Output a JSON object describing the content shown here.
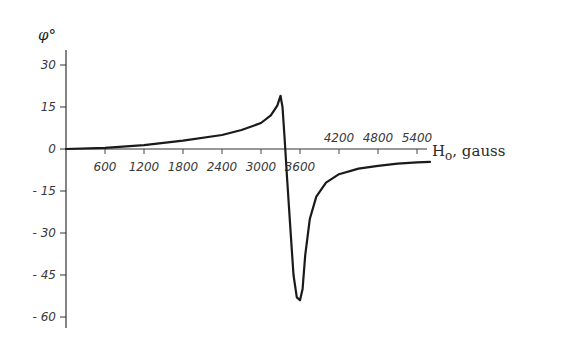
{
  "chart_data": {
    "type": "line",
    "title": "",
    "xlabel": "H",
    "xlabel_subscript": "o",
    "xlabel_unit": ", gauss",
    "ylabel": "φ°",
    "xlim": [
      0,
      5700
    ],
    "ylim": [
      -63,
      36
    ],
    "grid": false,
    "legend": "none",
    "x_ticks": [
      600,
      1200,
      1800,
      2400,
      3000,
      3600,
      4200,
      4800,
      5400
    ],
    "x_tick_labels": [
      "600",
      "1200",
      "1800",
      "2400",
      "3000",
      "3600",
      "4200",
      "4800",
      "5400"
    ],
    "x_tick_label_positions": [
      "below",
      "below",
      "below",
      "below",
      "below",
      "below",
      "above",
      "above",
      "above"
    ],
    "y_ticks": [
      30,
      15,
      0,
      -15,
      -30,
      -45,
      -60
    ],
    "y_tick_labels": [
      "30",
      "15",
      "0",
      "- 15",
      "- 30",
      "- 45",
      "- 60"
    ],
    "series": [
      {
        "name": "phase angle",
        "x": [
          0,
          600,
          1200,
          1800,
          2400,
          2700,
          3000,
          3150,
          3250,
          3300,
          3330,
          3360,
          3400,
          3450,
          3500,
          3550,
          3600,
          3640,
          3680,
          3750,
          3850,
          4000,
          4200,
          4500,
          4800,
          5100,
          5400,
          5600
        ],
        "y": [
          0,
          0.4,
          1.4,
          3,
          5,
          6.8,
          9.3,
          12,
          15.5,
          19,
          15,
          5,
          -10,
          -28,
          -45,
          -53,
          -54,
          -50,
          -38,
          -25,
          -17,
          -12,
          -9,
          -7,
          -6,
          -5.2,
          -4.8,
          -4.6
        ]
      }
    ]
  }
}
